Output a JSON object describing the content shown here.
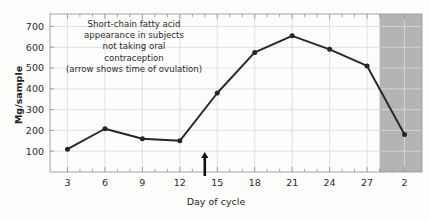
{
  "chart_data": {
    "type": "line",
    "title_lines": [
      "Short-chain fatty acid",
      "appearance in subjects",
      "not taking oral",
      "contraception",
      "(arrow shows time of ovulation)"
    ],
    "xlabel": "Day of cycle",
    "ylabel": "Mg/sample",
    "x": [
      3,
      6,
      9,
      12,
      15,
      18,
      21,
      24,
      30
    ],
    "categories": [
      "3",
      "6",
      "9",
      "12",
      "15",
      "18",
      "21",
      "24",
      "27",
      "2"
    ],
    "values": [
      110,
      208,
      160,
      150,
      380,
      575,
      655,
      590,
      510,
      180
    ],
    "point_x_days": [
      3,
      6,
      9,
      12,
      15,
      18,
      21,
      24,
      27,
      30
    ],
    "xtick_values": [
      3,
      6,
      9,
      12,
      15,
      18,
      21,
      24,
      27,
      30
    ],
    "xtick_labels": [
      "3",
      "6",
      "9",
      "12",
      "15",
      "18",
      "21",
      "24",
      "27",
      "2"
    ],
    "ytick_values": [
      100,
      200,
      300,
      400,
      500,
      600,
      700
    ],
    "ytick_labels": [
      "100",
      "200",
      "300",
      "400",
      "500",
      "600",
      "700"
    ],
    "xlim": [
      1.6,
      31.4
    ],
    "ylim": [
      0,
      760
    ],
    "grid": true,
    "legend": "none",
    "series_color": "#262626",
    "grid_color": "#d9d9d9",
    "shaded_band": {
      "label": "next cycle region",
      "x_start": 28.0,
      "x_end": 31.4,
      "color": "#b4b4b4"
    },
    "annotations": [
      {
        "name": "ovulation-arrow",
        "type": "arrow",
        "x_day": 14,
        "description": "arrow shows time of ovulation"
      }
    ]
  }
}
